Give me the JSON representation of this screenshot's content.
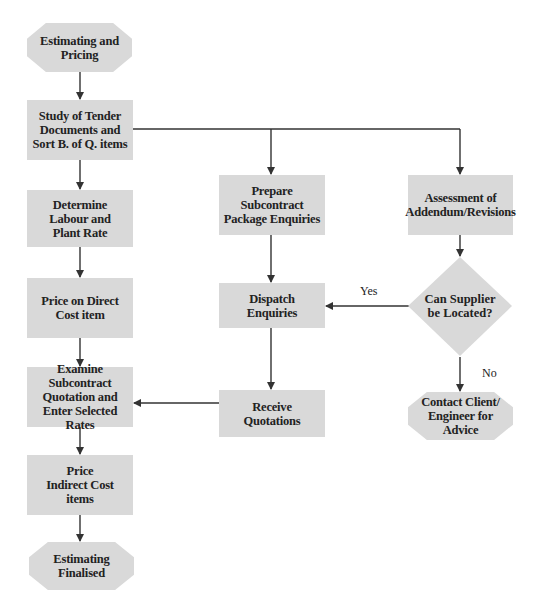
{
  "diagram": {
    "type": "flowchart",
    "colors": {
      "node_fill": "#d9d9d9",
      "line": "#333333",
      "text": "#222222",
      "background": "#ffffff"
    },
    "nodes": {
      "start": {
        "label": "Estimating and Pricing",
        "shape": "octagon"
      },
      "study": {
        "label": "Study of Tender Documents and Sort B. of Q. items",
        "shape": "rectangle"
      },
      "determine": {
        "label": "Determine Labour and Plant Rate",
        "shape": "rectangle"
      },
      "price_direct": {
        "label": "Price on Direct Cost item",
        "shape": "rectangle"
      },
      "examine": {
        "label": "Examine Subcontract Quotation and Enter Selected Rates",
        "shape": "rectangle"
      },
      "price_indirect": {
        "label": "Price Indirect Cost items",
        "shape": "rectangle"
      },
      "end": {
        "label": "Estimating Finalised",
        "shape": "octagon"
      },
      "prepare": {
        "label": "Prepare Subcontract Package Enquiries",
        "shape": "rectangle"
      },
      "dispatch": {
        "label": "Dispatch Enquiries",
        "shape": "rectangle"
      },
      "receive": {
        "label": "Receive Quotations",
        "shape": "rectangle"
      },
      "assessment": {
        "label": "Assessment of Addendum/Revisions",
        "shape": "rectangle"
      },
      "decision": {
        "label": "Can Supplier be Located?",
        "shape": "diamond"
      },
      "contact": {
        "label": "Contact Client/ Engineer for Advice",
        "shape": "octagon"
      }
    },
    "edge_labels": {
      "yes": "Yes",
      "no": "No"
    },
    "edges": [
      {
        "from": "start",
        "to": "study"
      },
      {
        "from": "study",
        "to": "determine"
      },
      {
        "from": "study",
        "to": "prepare"
      },
      {
        "from": "study",
        "to": "assessment"
      },
      {
        "from": "determine",
        "to": "price_direct"
      },
      {
        "from": "price_direct",
        "to": "examine"
      },
      {
        "from": "examine",
        "to": "price_indirect"
      },
      {
        "from": "price_indirect",
        "to": "end"
      },
      {
        "from": "prepare",
        "to": "dispatch"
      },
      {
        "from": "dispatch",
        "to": "receive"
      },
      {
        "from": "receive",
        "to": "examine"
      },
      {
        "from": "assessment",
        "to": "decision"
      },
      {
        "from": "decision",
        "to": "dispatch",
        "label": "Yes"
      },
      {
        "from": "decision",
        "to": "contact",
        "label": "No"
      }
    ]
  }
}
